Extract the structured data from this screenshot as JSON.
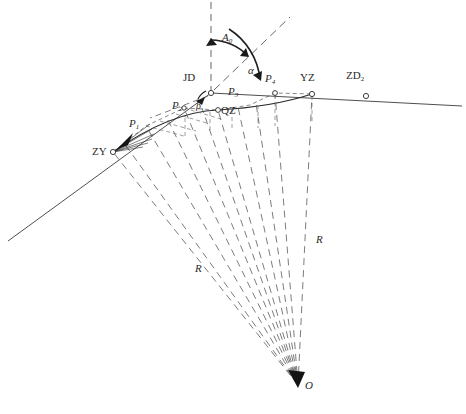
{
  "diagram": {
    "type": "engineering-survey-diagram",
    "canvas": {
      "width": 466,
      "height": 414
    },
    "stroke_color": "#3a3a3a",
    "dash_color": "#555555",
    "background": "#ffffff"
  },
  "points": [
    {
      "id": "ZY",
      "label": "ZY",
      "x": 113,
      "y": 152,
      "label_x": 92,
      "label_y": 146,
      "marker": "circle"
    },
    {
      "id": "P1",
      "label": "P",
      "sub": "1",
      "x": 146,
      "y": 126,
      "label_x": 129,
      "label_y": 118,
      "marker": "none"
    },
    {
      "id": "P2",
      "label": "P",
      "sub": "2",
      "x": 184,
      "y": 108,
      "label_x": 172,
      "label_y": 100,
      "marker": "circle"
    },
    {
      "id": "JD",
      "label": "JD",
      "x": 211,
      "y": 93,
      "label_x": 183,
      "label_y": 72,
      "marker": "circle"
    },
    {
      "id": "QZ",
      "label": "QZ",
      "x": 218,
      "y": 110,
      "label_x": 221,
      "label_y": 105,
      "marker": "circle"
    },
    {
      "id": "P3",
      "label": "P",
      "sub": "3",
      "x": 232,
      "y": 100,
      "label_x": 228,
      "label_y": 86,
      "marker": "none"
    },
    {
      "id": "P4",
      "label": "P",
      "sub": "4",
      "x": 275,
      "y": 93,
      "label_x": 265,
      "label_y": 73,
      "marker": "circle"
    },
    {
      "id": "YZ",
      "label": "YZ",
      "x": 312,
      "y": 94,
      "label_x": 300,
      "label_y": 72,
      "marker": "circle"
    },
    {
      "id": "ZD2",
      "label": "ZD",
      "sub": "2",
      "x": 366,
      "y": 96,
      "label_x": 346,
      "label_y": 70,
      "marker": "circle"
    },
    {
      "id": "O",
      "label": "O",
      "x": 298,
      "y": 385,
      "label_x": 305,
      "label_y": 380,
      "marker": "none"
    }
  ],
  "angles": [
    {
      "id": "A0",
      "label": "A",
      "sub": "0",
      "x": 222,
      "y": 32
    },
    {
      "id": "alpha",
      "label": "α",
      "x": 248,
      "y": 65
    },
    {
      "id": "beta",
      "label": "β",
      "x": 198,
      "y": 102
    }
  ],
  "radii_labels": [
    {
      "id": "R-left",
      "label": "R",
      "x": 195,
      "y": 263
    },
    {
      "id": "R-right",
      "label": "R",
      "x": 316,
      "y": 234
    }
  ],
  "legend_notes": {
    "ZY": "直圆点 (start of curve)",
    "QZ": "曲中点 (midpoint of curve)",
    "YZ": "圆直点 (end of curve)",
    "JD": "交点 (intersection point)",
    "O": "圆心 (curve centre)",
    "R": "半径 (radius)"
  }
}
